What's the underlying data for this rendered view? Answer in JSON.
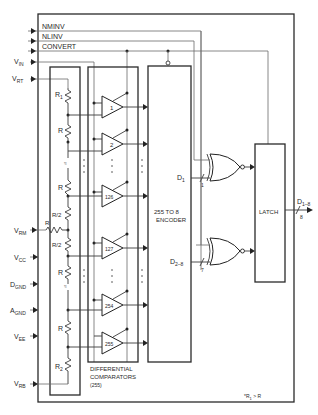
{
  "inputs": {
    "nminv": "NMINV",
    "nlinv": "NLINV",
    "convert": "CONVERT",
    "vin": {
      "main": "V",
      "sub": "IN"
    },
    "vrt": {
      "main": "V",
      "sub": "RT"
    },
    "vrm": {
      "main": "V",
      "sub": "RM"
    },
    "vcc": {
      "main": "V",
      "sub": "CC"
    },
    "dgnd": {
      "main": "D",
      "sub": "GND"
    },
    "agnd": {
      "main": "A",
      "sub": "GND"
    },
    "vee": {
      "main": "V",
      "sub": "EE"
    },
    "vrb": {
      "main": "V",
      "sub": "RB"
    }
  },
  "resistors": {
    "r1": {
      "main": "R",
      "sub": "1",
      "mark": "*"
    },
    "r": "R",
    "r_half": "R/2",
    "r_mid": "R",
    "r2": {
      "main": "R",
      "sub": "2"
    }
  },
  "comparators": {
    "labels": [
      "1",
      "2",
      "126",
      "127",
      "254",
      "255"
    ],
    "caption_line1": "DIFFERENTIAL",
    "caption_line2": "COMPARATORS",
    "caption_line3": "(255)"
  },
  "encoder": {
    "line1": "255 TO 8",
    "line2": "ENCODER"
  },
  "outputs": {
    "d1": {
      "main": "D",
      "sub": "1",
      "bus": "1"
    },
    "d28": {
      "main": "D",
      "sub": "2–8",
      "bus": "7"
    },
    "latch": "LATCH",
    "dout": {
      "main": "D",
      "sub": "1–8",
      "bus": "8"
    }
  },
  "footnote": {
    "mark": "*",
    "main": "R",
    "sub": "1",
    "rest": " > R"
  }
}
